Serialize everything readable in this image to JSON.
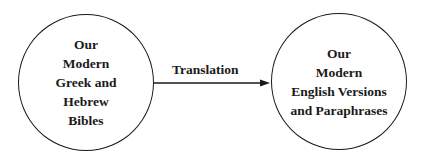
{
  "nodes": [
    {
      "id": "source",
      "lines": [
        "Our",
        "Modern",
        "Greek and",
        "Hebrew",
        "Bibles"
      ]
    },
    {
      "id": "target",
      "lines": [
        "Our",
        "Modern",
        "English Versions",
        "and Paraphrases"
      ]
    }
  ],
  "edge": {
    "from": "source",
    "to": "target",
    "label": "Translation"
  },
  "colors": {
    "stroke": "#1a1a1a",
    "background": "#ffffff"
  }
}
